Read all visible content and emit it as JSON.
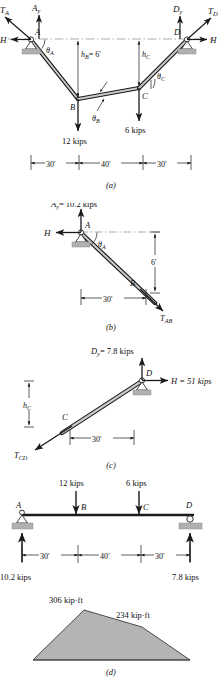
{
  "figure": {
    "panels": [
      {
        "id": "a",
        "label": "(a)",
        "caption": "Cable ABCD with supports at A and D and loads at B and C",
        "nodes": [
          "A",
          "B",
          "C",
          "D"
        ],
        "forces": {
          "TA": "T_A",
          "Ay": "A_y",
          "H_left": "H",
          "Dy": "D_y",
          "TD": "T_D",
          "H_right": "H"
        },
        "force_labels": {
          "TA": "T",
          "TA_sub": "A",
          "Ay": "A",
          "Ay_sub": "y",
          "H": "H",
          "Dy": "D",
          "Dy_sub": "y",
          "TD": "T",
          "TD_sub": "D"
        },
        "angles": {
          "thetaA": "θ",
          "thetaA_sub": "A",
          "thetaB": "θ",
          "thetaB_sub": "B",
          "thetaC": "θ",
          "thetaC_sub": "C"
        },
        "heights": {
          "hB": "h",
          "hB_sub": "B",
          "hB_value": "= 6'",
          "hC": "h",
          "hC_sub": "C"
        },
        "loads": [
          {
            "node": "B",
            "label": "12 kips"
          },
          {
            "node": "C",
            "label": "6 kips"
          }
        ],
        "dimensions": [
          "30'",
          "40'",
          "30'"
        ]
      },
      {
        "id": "b",
        "label": "(b)",
        "caption": "Free body diagram of segment AB",
        "reaction_vertical": "= 10.2 kips",
        "reaction_vertical_sym": "A",
        "reaction_vertical_sub": "y",
        "reaction_horizontal": "H",
        "node_start": "A",
        "node_end": "B",
        "angle": "θ",
        "angle_sub": "A",
        "tension": "T",
        "tension_sub": "AB",
        "height": "6'",
        "span": "30'"
      },
      {
        "id": "c",
        "label": "(c)",
        "caption": "Free body diagram of segment CD",
        "reaction_vertical_sym": "D",
        "reaction_vertical_sub": "y",
        "reaction_vertical": "= 7.8 kips",
        "reaction_horizontal": "H = 51 kips",
        "node_start": "C",
        "node_end": "D",
        "height_sym": "h",
        "height_sub": "C",
        "tension": "T",
        "tension_sub": "CD",
        "span": "30'"
      },
      {
        "id": "d",
        "label": "(d)",
        "caption": "Equivalent simple beam and bending moment diagram",
        "beam_nodes": [
          "A",
          "B",
          "C",
          "D"
        ],
        "beam_loads": [
          {
            "node": "B",
            "label": "12 kips"
          },
          {
            "node": "C",
            "label": "6 kips"
          }
        ],
        "reactions": [
          {
            "node": "A",
            "label": "10.2 kips"
          },
          {
            "node": "D",
            "label": "7.8 kips"
          }
        ],
        "dimensions": [
          "30'",
          "40'",
          "30'"
        ],
        "moment_diagram": {
          "peak_B": "306 kip·ft",
          "peak_C": "234 kip·ft"
        }
      }
    ],
    "colors": {
      "line": "#1a1a1a",
      "cable_fill": "#b9b9b9",
      "support_fill": "#b0b0b0",
      "dash": "#8a8a8a",
      "moment_fill": "#b4b4b4"
    }
  }
}
